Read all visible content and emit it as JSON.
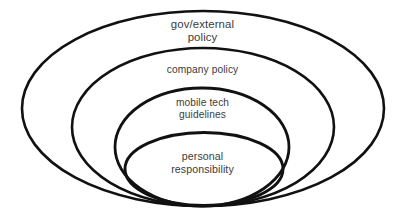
{
  "diagram": {
    "type": "nested-ellipse-funnel",
    "background_color": "#ffffff",
    "outline_color": "#111111",
    "text_color": "#3b3b3b",
    "layers": [
      {
        "id": "gov-external-policy",
        "order": 1,
        "scope": "outermost",
        "label": "gov/external\npolicy",
        "label_lines": [
          "gov/external",
          "policy"
        ],
        "stroke_width": 2.6
      },
      {
        "id": "company-policy",
        "order": 2,
        "scope": "second",
        "label": "company policy",
        "label_lines": [
          "company policy"
        ],
        "stroke_width": 2.6
      },
      {
        "id": "mobile-tech-guidelines",
        "order": 3,
        "scope": "third",
        "label": "mobile tech\nguidelines",
        "label_lines": [
          "mobile tech",
          "guidelines"
        ],
        "stroke_width": 2.8
      },
      {
        "id": "personal-responsibility",
        "order": 4,
        "scope": "innermost",
        "label": "personal\nresponsibility",
        "label_lines": [
          "personal",
          "responsibility"
        ],
        "stroke_width": 2.9
      }
    ]
  }
}
